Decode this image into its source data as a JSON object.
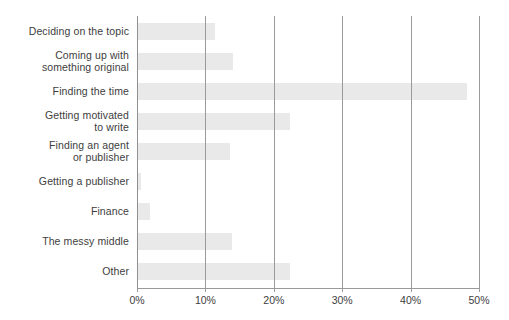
{
  "chart_data": {
    "type": "bar",
    "orientation": "horizontal",
    "title": "",
    "subtitle": "",
    "xlabel": "",
    "ylabel": "",
    "xlim": [
      0,
      50
    ],
    "xtick_labels": [
      "0%",
      "10%",
      "20%",
      "30%",
      "40%",
      "50%"
    ],
    "xtick_values": [
      0,
      10,
      20,
      30,
      40,
      50
    ],
    "grid": "vertical",
    "legend": "none",
    "bar_color": "#e9e9e9",
    "gridline_color": "#9a9a9a",
    "text_color": "#3d3d3d",
    "background": "#ffffff",
    "categories": [
      "Deciding on the topic",
      "Coming up with something original",
      "Finding the time",
      "Getting motivated to write",
      "Finding an agent or publisher",
      "Getting a publisher",
      "Finance",
      "The messy middle",
      "Other"
    ],
    "values": [
      11.4,
      14.0,
      48.2,
      22.4,
      13.6,
      0.6,
      1.9,
      13.9,
      22.4
    ]
  },
  "labels": {
    "lines": [
      [
        "Deciding on the topic"
      ],
      [
        "Coming up with",
        "something original"
      ],
      [
        "Finding the time"
      ],
      [
        "Getting motivated",
        "to write"
      ],
      [
        "Finding an agent",
        "or publisher"
      ],
      [
        "Getting a publisher"
      ],
      [
        "Finance"
      ],
      [
        "The messy middle"
      ],
      [
        "Other"
      ]
    ]
  }
}
